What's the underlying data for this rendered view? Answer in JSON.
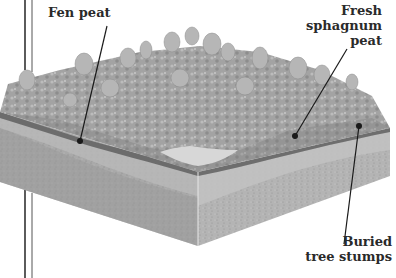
{
  "diagram": {
    "type": "block-diagram",
    "labels": [
      {
        "id": "fen-peat",
        "lines": [
          "Fen peat"
        ]
      },
      {
        "id": "fresh-sphagnum-peat",
        "lines": [
          "Fresh",
          "sphagnum",
          "peat"
        ]
      },
      {
        "id": "buried-tree-stumps",
        "lines": [
          "Buried",
          "tree stumps"
        ]
      }
    ]
  },
  "colors": {
    "text": "#2a2a2a",
    "leader": "#1a1a1a",
    "soil_light": "#bdbdbd",
    "soil_mid": "#a6a6a6",
    "soil_dark": "#8e8e8e",
    "peat_band": "#6e6e6e",
    "vegetation": "#9c9c9c",
    "pond": "#d4d4d4"
  }
}
